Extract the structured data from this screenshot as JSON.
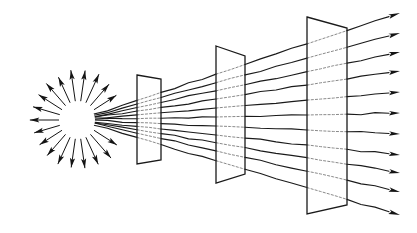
{
  "figure": {
    "type": "line-diagram",
    "background_color": "#ffffff",
    "ink_color": "#141414",
    "dim_ink_color": "#8a8a8a",
    "canvas": {
      "width": 417,
      "height": 233
    }
  },
  "source": {
    "name": "radiating-point-source",
    "center": {
      "x": 78,
      "y": 120
    },
    "core_radius": 17,
    "burst_inner_radius": 19,
    "burst_outer_radius": 48,
    "burst_arrow_count": 22,
    "burst_gap_start_deg": -28,
    "burst_gap_end_deg": 28,
    "description": "starburst of outward-pointing arrows with a blank circular core"
  },
  "ray_fan": {
    "name": "ray-fan",
    "origin": {
      "x": 78,
      "y": 120
    },
    "ray_count": 11,
    "end_x": 400,
    "end_y_values": [
      13,
      33,
      52,
      71,
      92,
      113,
      134,
      155,
      173,
      192,
      215
    ],
    "arrowhead_length": 11,
    "arrowhead_width": 4.6,
    "wobble_amplitude": 1.2,
    "note": "rays diverge from the point source and terminate in arrowheads at the right margin"
  },
  "screens": [
    {
      "name": "screen-1",
      "label": "first aperture",
      "index": 1,
      "corners": {
        "top_left": {
          "x": 137,
          "y": 75
        },
        "top_right": {
          "x": 161,
          "y": 79
        },
        "bottom_right": {
          "x": 161,
          "y": 160
        },
        "bottom_left": {
          "x": 137,
          "y": 164
        }
      }
    },
    {
      "name": "screen-2",
      "label": "second aperture",
      "index": 2,
      "corners": {
        "top_left": {
          "x": 216,
          "y": 46
        },
        "top_right": {
          "x": 245,
          "y": 56
        },
        "bottom_right": {
          "x": 245,
          "y": 174
        },
        "bottom_left": {
          "x": 216,
          "y": 183
        }
      }
    },
    {
      "name": "screen-3",
      "label": "third aperture",
      "index": 3,
      "corners": {
        "top_left": {
          "x": 307,
          "y": 17
        },
        "top_right": {
          "x": 347,
          "y": 28
        },
        "bottom_right": {
          "x": 347,
          "y": 205
        },
        "bottom_left": {
          "x": 307,
          "y": 214
        }
      }
    }
  ],
  "chart_data": {
    "type": "line",
    "xlabel": "",
    "ylabel": "",
    "xlim": [
      0,
      417
    ],
    "ylim": [
      233,
      0
    ],
    "grid": false,
    "legend": "none",
    "annotations": [
      "radiating point source at left",
      "11 diverging rays",
      "three trapezoidal screens in perspective",
      "rays exit right with arrowheads"
    ],
    "series": [
      {
        "name": "ray-1",
        "x": [
          78,
          400
        ],
        "y": [
          120,
          13
        ]
      },
      {
        "name": "ray-2",
        "x": [
          78,
          400
        ],
        "y": [
          120,
          33
        ]
      },
      {
        "name": "ray-3",
        "x": [
          78,
          400
        ],
        "y": [
          120,
          52
        ]
      },
      {
        "name": "ray-4",
        "x": [
          78,
          400
        ],
        "y": [
          120,
          71
        ]
      },
      {
        "name": "ray-5",
        "x": [
          78,
          400
        ],
        "y": [
          120,
          92
        ]
      },
      {
        "name": "ray-6",
        "x": [
          78,
          400
        ],
        "y": [
          120,
          113
        ]
      },
      {
        "name": "ray-7",
        "x": [
          78,
          400
        ],
        "y": [
          120,
          134
        ]
      },
      {
        "name": "ray-8",
        "x": [
          78,
          400
        ],
        "y": [
          120,
          155
        ]
      },
      {
        "name": "ray-9",
        "x": [
          78,
          400
        ],
        "y": [
          120,
          173
        ]
      },
      {
        "name": "ray-10",
        "x": [
          78,
          400
        ],
        "y": [
          120,
          192
        ]
      },
      {
        "name": "ray-11",
        "x": [
          78,
          400
        ],
        "y": [
          120,
          215
        ]
      }
    ]
  }
}
